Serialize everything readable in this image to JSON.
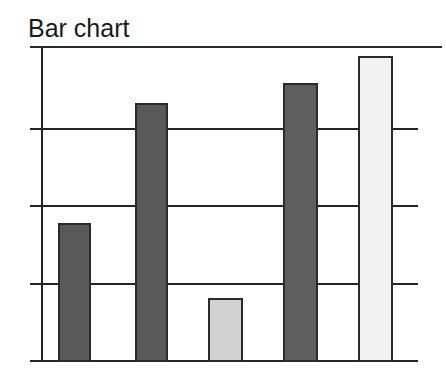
{
  "chart_data": {
    "type": "bar",
    "title": "Bar chart",
    "xlabel": "",
    "ylabel": "",
    "categories": [
      "1",
      "2",
      "3",
      "4",
      "5"
    ],
    "values": [
      1.75,
      3.28,
      0.79,
      3.54,
      3.89
    ],
    "ylim": [
      0,
      4
    ],
    "xlim": [
      0,
      5
    ],
    "grid": true,
    "gridlines_y": [
      1,
      2,
      3,
      4
    ],
    "tick_labels_y": [],
    "tick_labels_x": [],
    "legend": false,
    "legend_position": "none",
    "bar_colors": [
      "#595959",
      "#595959",
      "#d2d2d2",
      "#5e5e5e",
      "#f2f2f2"
    ],
    "bar_edge_color": "#2a2a2a",
    "series": [
      {
        "name": "series-1",
        "values": [
          1.75,
          3.28,
          0.79,
          3.54,
          3.89
        ]
      }
    ],
    "annotations": []
  },
  "figure": {
    "background_color": "#ffffff",
    "axis_color": "#242424",
    "title_color": "#1a1a1a"
  },
  "bars": [
    {
      "name": "bar-1",
      "value": 1.75,
      "color": "#595959",
      "left": 58,
      "top": 223,
      "width": 33,
      "height": 139
    },
    {
      "name": "bar-2",
      "value": 3.28,
      "color": "#595959",
      "left": 135,
      "top": 103,
      "width": 33,
      "height": 259
    },
    {
      "name": "bar-3",
      "value": 0.79,
      "color": "#d2d2d2",
      "left": 208,
      "top": 298,
      "width": 35,
      "height": 64
    },
    {
      "name": "bar-4",
      "value": 3.54,
      "color": "#5e5e5e",
      "left": 283,
      "top": 83,
      "width": 35,
      "height": 279
    },
    {
      "name": "bar-5",
      "value": 3.89,
      "color": "#f2f2f2",
      "left": 358,
      "top": 56,
      "width": 35,
      "height": 306
    }
  ],
  "gridlines": [
    {
      "name": "gridline-top",
      "y": 46,
      "left": 30,
      "width": 412
    },
    {
      "name": "gridline-level-3",
      "y": 128,
      "left": 30,
      "width": 388
    },
    {
      "name": "gridline-level-2",
      "y": 205,
      "left": 30,
      "width": 388
    },
    {
      "name": "gridline-level-1",
      "y": 283,
      "left": 30,
      "width": 388
    },
    {
      "name": "gridline-baseline",
      "y": 360,
      "left": 30,
      "width": 388
    }
  ]
}
